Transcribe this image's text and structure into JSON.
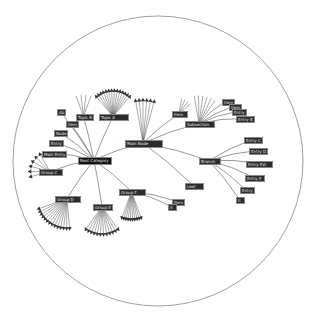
{
  "diagram": {
    "type": "hyperbolic-tree",
    "boundary": {
      "cx": 158,
      "cy": 161,
      "r": 145,
      "stroke": "#888888"
    },
    "edge_color": "#555555",
    "node_bg": "#2b2b2b",
    "node_text": "#e8e8e8",
    "root": {
      "id": "root",
      "label": "Root Category",
      "x": 78,
      "y": 157,
      "w": 32,
      "h": 6
    },
    "nodes": [
      {
        "id": "n1",
        "label": "Main Node",
        "x": 125,
        "y": 140,
        "w": 36,
        "h": 6,
        "parent": "root"
      },
      {
        "id": "n2",
        "label": "Subsection",
        "x": 185,
        "y": 121,
        "w": 28,
        "h": 5,
        "parent": "n1"
      },
      {
        "id": "n3",
        "label": "Item",
        "x": 172,
        "y": 111,
        "w": 14,
        "h": 5,
        "parent": "n1"
      },
      {
        "id": "n4",
        "label": "Branch",
        "x": 199,
        "y": 158,
        "w": 20,
        "h": 5,
        "parent": "n1"
      },
      {
        "id": "n5",
        "label": "Leaf",
        "x": 185,
        "y": 183,
        "w": 17,
        "h": 5,
        "parent": "n1"
      },
      {
        "id": "n6",
        "label": "Topic A",
        "x": 99,
        "y": 114,
        "w": 28,
        "h": 5,
        "parent": "root"
      },
      {
        "id": "n7",
        "label": "Topic B",
        "x": 76,
        "y": 114,
        "w": 15,
        "h": 5,
        "parent": "root"
      },
      {
        "id": "n8",
        "label": "Ab",
        "x": 57,
        "y": 109,
        "w": 7,
        "h": 5,
        "parent": "root"
      },
      {
        "id": "n9",
        "label": "Item",
        "x": 66,
        "y": 121,
        "w": 9,
        "h": 5,
        "parent": "root"
      },
      {
        "id": "n10",
        "label": "Node",
        "x": 54,
        "y": 130,
        "w": 12,
        "h": 5,
        "parent": "root"
      },
      {
        "id": "n11",
        "label": "Entry",
        "x": 49,
        "y": 140,
        "w": 13,
        "h": 5,
        "parent": "root"
      },
      {
        "id": "n12",
        "label": "Main Entry",
        "x": 42,
        "y": 151,
        "w": 18,
        "h": 5,
        "parent": "root"
      },
      {
        "id": "n13",
        "label": "Group C",
        "x": 39,
        "y": 169,
        "w": 22,
        "h": 5,
        "parent": "root"
      },
      {
        "id": "n14",
        "label": "Group D",
        "x": 55,
        "y": 196,
        "w": 24,
        "h": 5,
        "parent": "root"
      },
      {
        "id": "n15",
        "label": "Group E",
        "x": 93,
        "y": 204,
        "w": 18,
        "h": 5,
        "parent": "root"
      },
      {
        "id": "n16",
        "label": "Group F",
        "x": 119,
        "y": 189,
        "w": 25,
        "h": 5,
        "parent": "root"
      },
      {
        "id": "n17",
        "label": "Item",
        "x": 172,
        "y": 199,
        "w": 10,
        "h": 5,
        "parent": "n16"
      },
      {
        "id": "n18",
        "label": "It",
        "x": 168,
        "y": 204,
        "w": 7,
        "h": 5,
        "parent": "n16"
      },
      {
        "id": "n19",
        "label": "Item",
        "x": 222,
        "y": 99,
        "w": 6,
        "h": 5,
        "parent": "n2"
      },
      {
        "id": "n20",
        "label": "Item",
        "x": 229,
        "y": 104,
        "w": 8,
        "h": 5,
        "parent": "n2"
      },
      {
        "id": "n21",
        "label": "Entry",
        "x": 232,
        "y": 109,
        "w": 10,
        "h": 5,
        "parent": "n2"
      },
      {
        "id": "n22",
        "label": "Entry B",
        "x": 236,
        "y": 116,
        "w": 15,
        "h": 5,
        "parent": "n2"
      },
      {
        "id": "n23",
        "label": "Entry C",
        "x": 244,
        "y": 137,
        "w": 17,
        "h": 5,
        "parent": "n4"
      },
      {
        "id": "n24",
        "label": "Entry D",
        "x": 249,
        "y": 148,
        "w": 17,
        "h": 5,
        "parent": "n4"
      },
      {
        "id": "n25",
        "label": "Entry Ext",
        "x": 246,
        "y": 161,
        "w": 25,
        "h": 5,
        "parent": "n4"
      },
      {
        "id": "n26",
        "label": "Entry E",
        "x": 245,
        "y": 175,
        "w": 18,
        "h": 5,
        "parent": "n4"
      },
      {
        "id": "n27",
        "label": "Entry",
        "x": 240,
        "y": 187,
        "w": 11,
        "h": 5,
        "parent": "n4"
      },
      {
        "id": "n28",
        "label": "It",
        "x": 236,
        "y": 197,
        "w": 7,
        "h": 5,
        "parent": "n4"
      }
    ],
    "fans": [
      {
        "parent": "n6",
        "count": 14,
        "angle_from": -130,
        "angle_to": -50,
        "len": 28,
        "arrows": true
      },
      {
        "parent": "n7",
        "count": 4,
        "angle_from": -110,
        "angle_to": -70,
        "len": 22,
        "arrows": false
      },
      {
        "parent": "n1",
        "count": 6,
        "angle_from": -100,
        "angle_to": -75,
        "len": 45,
        "arrows": true
      },
      {
        "parent": "n3",
        "count": 4,
        "angle_from": -80,
        "angle_to": -40,
        "len": 15,
        "arrows": false
      },
      {
        "parent": "n2",
        "count": 6,
        "angle_from": -100,
        "angle_to": -55,
        "len": 28,
        "arrows": false
      },
      {
        "parent": "n13",
        "count": 6,
        "angle_from": 165,
        "angle_to": 240,
        "len": 22,
        "arrows": true
      },
      {
        "parent": "n14",
        "count": 14,
        "angle_from": 85,
        "angle_to": 160,
        "len": 32,
        "arrows": true
      },
      {
        "parent": "n15",
        "count": 12,
        "angle_from": 55,
        "angle_to": 125,
        "len": 30,
        "arrows": true
      },
      {
        "parent": "n16",
        "count": 10,
        "angle_from": 70,
        "angle_to": 110,
        "len": 30,
        "arrows": true
      }
    ]
  }
}
